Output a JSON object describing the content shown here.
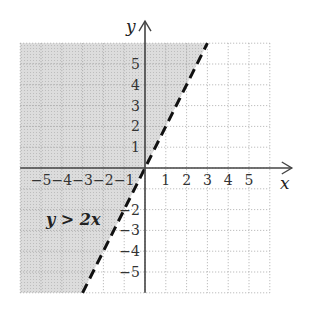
{
  "chart_data": {
    "type": "line",
    "title": "",
    "inequality_label": "y > 2x",
    "boundary_line": {
      "equation": "y = 2x",
      "slope": 2,
      "intercept": 0,
      "style": "dashed"
    },
    "shaded_region": "above/left of line (y > 2x)",
    "xlabel": "x",
    "ylabel": "y",
    "xlim": [
      -6,
      6
    ],
    "ylim": [
      -6,
      6
    ],
    "x_ticks": [
      "-5",
      "-4",
      "-3",
      "-2",
      "-1",
      "1",
      "2",
      "3",
      "4",
      "5"
    ],
    "y_ticks": [
      "5",
      "4",
      "3",
      "2",
      "1",
      "-2",
      "-3",
      "-4",
      "-5"
    ],
    "grid": true,
    "colors": {
      "shade": "#d8d8d8",
      "grid": "#9a9a9a",
      "axis": "#444444",
      "line": "#111111"
    }
  }
}
